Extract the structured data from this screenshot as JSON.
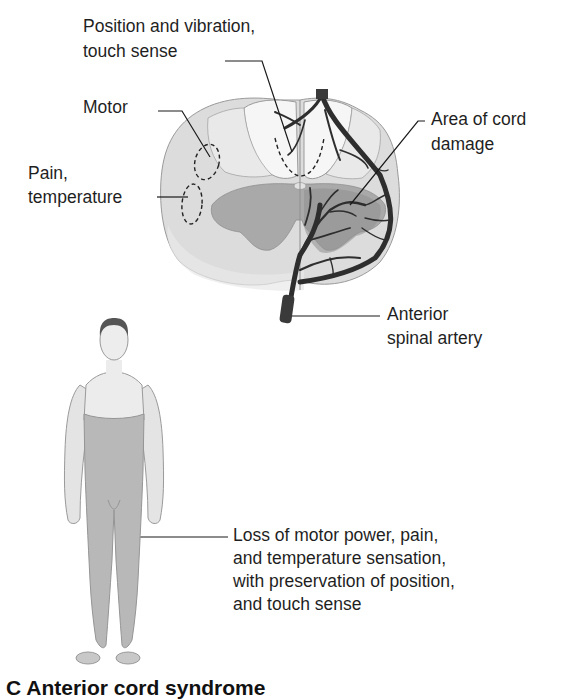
{
  "figure": {
    "panel_letter": "C",
    "caption": "C Anterior cord syndrome"
  },
  "cross_section": {
    "labels": {
      "position_vibration_line1": "Position and vibration,",
      "position_vibration_line2": "touch sense",
      "motor": "Motor",
      "pain_temp_line1": "Pain,",
      "pain_temp_line2": "temperature",
      "cord_damage_line1": "Area of cord",
      "cord_damage_line2": "damage",
      "artery_line1": "Anterior",
      "artery_line2": "spinal artery"
    }
  },
  "body_figure": {
    "annotation": {
      "line1": "Loss of motor power, pain,",
      "line2": "and temperature sensation,",
      "line3": "with preservation of position,",
      "line4": "and touch sense"
    }
  },
  "colors": {
    "white_matter": "#dcdcdc",
    "dorsal_column": "#f4f4f4",
    "gray_matter": "#a9a9a9",
    "damage_area": "#999999",
    "artery": "#2e2e2e",
    "body_skin": "#e6e6e6",
    "body_affected": "#b8b8b8",
    "text": "#1f1f1f"
  }
}
